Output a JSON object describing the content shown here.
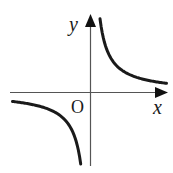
{
  "diagram": {
    "type": "hyperbola graph (y = k/x, k > 0)",
    "axes": {
      "x_label": "x",
      "y_label": "y",
      "origin_label": "O"
    },
    "curves": [
      {
        "name": "branch-first-quadrant",
        "quadrant": "I"
      },
      {
        "name": "branch-third-quadrant",
        "quadrant": "III"
      }
    ],
    "colors": {
      "axis": "#555555",
      "curve": "#1a1a1a",
      "background": "#ffffff"
    }
  }
}
